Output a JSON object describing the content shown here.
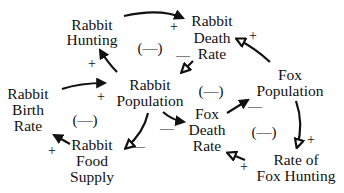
{
  "diagram": {
    "type": "causal-loop",
    "nodes": {
      "rabbit_hunting": {
        "lines": [
          "Rabbit",
          "Hunting"
        ]
      },
      "rabbit_death_rate": {
        "lines": [
          "Rabbit",
          "Death",
          "Rate"
        ]
      },
      "fox_population": {
        "lines": [
          "Fox",
          "Population"
        ]
      },
      "rabbit_population": {
        "lines": [
          "Rabbit",
          "Population"
        ]
      },
      "rabbit_birth_rate": {
        "lines": [
          "Rabbit",
          "Birth",
          "Rate"
        ]
      },
      "fox_death_rate": {
        "lines": [
          "Fox",
          "Death",
          "Rate"
        ]
      },
      "rabbit_food_supply": {
        "lines": [
          "Rabbit",
          "Food",
          "Supply"
        ]
      },
      "rate_of_fox_hunting": {
        "lines": [
          "Rate of",
          "Fox Hunting"
        ]
      }
    },
    "links": [
      {
        "from": "Rabbit Population",
        "to": "Rabbit Hunting",
        "sign": "+"
      },
      {
        "from": "Rabbit Hunting",
        "to": "Rabbit Death Rate",
        "sign": "+"
      },
      {
        "from": "Rabbit Death Rate",
        "to": "Rabbit Population",
        "sign": "—"
      },
      {
        "from": "Fox Population",
        "to": "Rabbit Death Rate",
        "sign": "+"
      },
      {
        "from": "Rabbit Birth Rate",
        "to": "Rabbit Population",
        "sign": "+"
      },
      {
        "from": "Rabbit Population",
        "to": "Rabbit Food Supply",
        "sign": "—"
      },
      {
        "from": "Rabbit Food Supply",
        "to": "Rabbit Birth Rate",
        "sign": "+"
      },
      {
        "from": "Rabbit Population",
        "to": "Fox Death Rate",
        "sign": "—"
      },
      {
        "from": "Fox Death Rate",
        "to": "Fox Population",
        "sign": "—"
      },
      {
        "from": "Fox Population",
        "to": "Rate of Fox Hunting",
        "sign": "+"
      },
      {
        "from": "Rate of Fox Hunting",
        "to": "Fox Death Rate",
        "sign": "+"
      }
    ],
    "loops": [
      {
        "label": "(—)",
        "position": "top"
      },
      {
        "label": "(—)",
        "position": "left"
      },
      {
        "label": "(—)",
        "position": "center"
      },
      {
        "label": "(—)",
        "position": "right"
      }
    ],
    "signs": {
      "hunting_to_death": "+",
      "pop_to_hunting": "+",
      "death_to_pop": "—",
      "fox_to_death": "+",
      "birth_to_pop": "+",
      "food_to_birth": "+",
      "pop_to_food": "—",
      "pop_to_foxdeath": "—",
      "foxdeath_to_fox": "—",
      "fox_to_hunting": "+",
      "hunting_to_foxdeath": "+"
    }
  }
}
